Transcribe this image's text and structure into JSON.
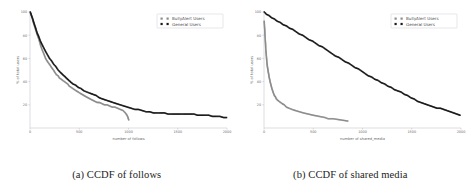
{
  "figure": {
    "subfigures": [
      {
        "id": "a",
        "caption": "(a) CCDF of follows",
        "chart_ref": 0
      },
      {
        "id": "b",
        "caption": "(b) CCDF of shared media",
        "chart_ref": 1
      }
    ]
  },
  "colors": {
    "bullyalert": "#8c8c8c",
    "general": "#1a1a1a",
    "axis": "#b9b9c4",
    "tick_text": "#6a6a6a",
    "caption_text": "#1b1b1b",
    "background": "#ffffff"
  },
  "chart_data": [
    {
      "type": "scatter",
      "title": "",
      "xlabel": "number of follows",
      "ylabel": "% of total users",
      "xlim": [
        0,
        2000
      ],
      "ylim": [
        0,
        100
      ],
      "xticks": [
        0,
        500,
        1000,
        1500,
        2000
      ],
      "xticklabels": [
        "0",
        "500",
        "1000",
        "1500",
        "2000"
      ],
      "yticks": [
        20,
        40,
        60,
        80,
        100
      ],
      "yticklabels": [
        "20",
        "40",
        "60",
        "80",
        "100"
      ],
      "grid": false,
      "legend_position": "upper right",
      "legend": [
        "BullyAlert Users",
        "General Users"
      ],
      "series": [
        {
          "name": "BullyAlert Users",
          "color": "#8c8c8c",
          "marker": "square",
          "x": [
            5,
            18,
            30,
            45,
            60,
            75,
            92,
            108,
            125,
            140,
            158,
            172,
            188,
            205,
            220,
            238,
            252,
            268,
            285,
            300,
            318,
            332,
            350,
            365,
            382,
            400,
            418,
            435,
            452,
            470,
            490,
            508,
            528,
            548,
            568,
            590,
            612,
            635,
            658,
            682,
            705,
            730,
            755,
            782,
            808,
            835,
            862,
            890,
            918,
            945,
            968,
            985,
            995,
            1002
          ],
          "y": [
            99,
            96,
            92,
            88,
            84,
            80,
            76,
            71,
            67,
            64,
            60,
            58,
            56,
            54,
            52,
            50,
            48,
            46,
            45,
            43,
            42,
            41,
            40,
            39,
            38,
            36,
            35,
            34,
            33,
            32,
            31,
            30,
            29,
            28,
            27,
            26,
            25,
            24,
            23,
            22,
            22,
            21,
            20,
            20,
            19,
            18,
            18,
            17,
            16,
            15,
            13,
            11,
            9,
            7
          ]
        },
        {
          "name": "General Users",
          "color": "#1a1a1a",
          "marker": "square",
          "x": [
            3,
            15,
            28,
            42,
            58,
            72,
            88,
            105,
            122,
            140,
            158,
            178,
            198,
            218,
            240,
            262,
            285,
            308,
            332,
            358,
            382,
            408,
            435,
            462,
            490,
            518,
            548,
            578,
            608,
            640,
            672,
            705,
            738,
            772,
            808,
            842,
            878,
            915,
            952,
            990,
            1028,
            1065,
            1102,
            1140,
            1178,
            1215,
            1252,
            1290,
            1328,
            1365,
            1402,
            1440,
            1478,
            1515,
            1552,
            1590,
            1628,
            1665,
            1702,
            1740,
            1778,
            1815,
            1852,
            1890,
            1928,
            1965,
            1995
          ],
          "y": [
            100,
            97,
            94,
            90,
            86,
            82,
            79,
            75,
            72,
            69,
            66,
            63,
            60,
            58,
            55,
            53,
            50,
            48,
            46,
            44,
            42,
            40,
            38,
            37,
            35,
            34,
            32,
            31,
            30,
            29,
            28,
            26,
            25,
            24,
            23,
            22,
            21,
            20,
            19,
            18,
            17,
            16,
            16,
            15,
            14,
            14,
            13,
            13,
            13,
            13,
            12,
            12,
            12,
            12,
            12,
            12,
            12,
            12,
            11,
            11,
            11,
            11,
            10,
            10,
            10,
            9,
            9
          ]
        }
      ]
    },
    {
      "type": "scatter",
      "title": "",
      "xlabel": "number of shared_media",
      "ylabel": "% of total users",
      "xlim": [
        0,
        2000
      ],
      "ylim": [
        0,
        100
      ],
      "xticks": [
        0,
        500,
        1000,
        1500,
        2000
      ],
      "xticklabels": [
        "0",
        "500",
        "1000",
        "1500",
        "2000"
      ],
      "yticks": [
        20,
        40,
        60,
        80,
        100
      ],
      "yticklabels": [
        "20",
        "40",
        "60",
        "80",
        "100"
      ],
      "grid": false,
      "legend_position": "upper right",
      "legend": [
        "BullyAlert Users",
        "General Users"
      ],
      "series": [
        {
          "name": "BullyAlert Users",
          "color": "#8c8c8c",
          "marker": "square",
          "x": [
            2,
            5,
            8,
            10,
            13,
            16,
            18,
            21,
            24,
            27,
            30,
            33,
            36,
            40,
            44,
            48,
            52,
            57,
            62,
            68,
            74,
            80,
            88,
            96,
            105,
            115,
            126,
            138,
            152,
            168,
            185,
            205,
            228,
            255,
            285,
            320,
            360,
            400,
            450,
            500,
            560,
            620,
            650,
            680,
            700,
            850
          ],
          "y": [
            92,
            88,
            84,
            80,
            76,
            72,
            68,
            65,
            62,
            59,
            56,
            54,
            52,
            50,
            48,
            46,
            44,
            42,
            40,
            38,
            36,
            34,
            32,
            30,
            28,
            27,
            25,
            24,
            23,
            22,
            21,
            20,
            18,
            17,
            16,
            15,
            14,
            13,
            12,
            11,
            10,
            9,
            8,
            8,
            8,
            6
          ]
        },
        {
          "name": "General Users",
          "color": "#1a1a1a",
          "marker": "square",
          "x": [
            3,
            25,
            50,
            78,
            105,
            135,
            165,
            195,
            228,
            260,
            292,
            325,
            358,
            392,
            425,
            458,
            492,
            525,
            558,
            592,
            625,
            658,
            692,
            725,
            758,
            792,
            825,
            858,
            892,
            925,
            958,
            992,
            1025,
            1058,
            1092,
            1125,
            1158,
            1192,
            1225,
            1258,
            1292,
            1325,
            1358,
            1392,
            1425,
            1458,
            1492,
            1525,
            1558,
            1592,
            1625,
            1658,
            1692,
            1725,
            1758,
            1792,
            1825,
            1858,
            1892,
            1925,
            1958,
            1990
          ],
          "y": [
            100,
            98,
            97,
            95,
            94,
            92,
            91,
            89,
            88,
            86,
            85,
            83,
            81,
            80,
            78,
            76,
            75,
            73,
            71,
            70,
            68,
            66,
            64,
            62,
            61,
            59,
            57,
            56,
            54,
            52,
            51,
            49,
            47,
            45,
            44,
            42,
            41,
            39,
            38,
            36,
            35,
            33,
            32,
            31,
            29,
            28,
            26,
            25,
            23,
            22,
            21,
            20,
            19,
            18,
            17,
            17,
            16,
            15,
            14,
            13,
            12,
            11
          ]
        }
      ]
    }
  ]
}
